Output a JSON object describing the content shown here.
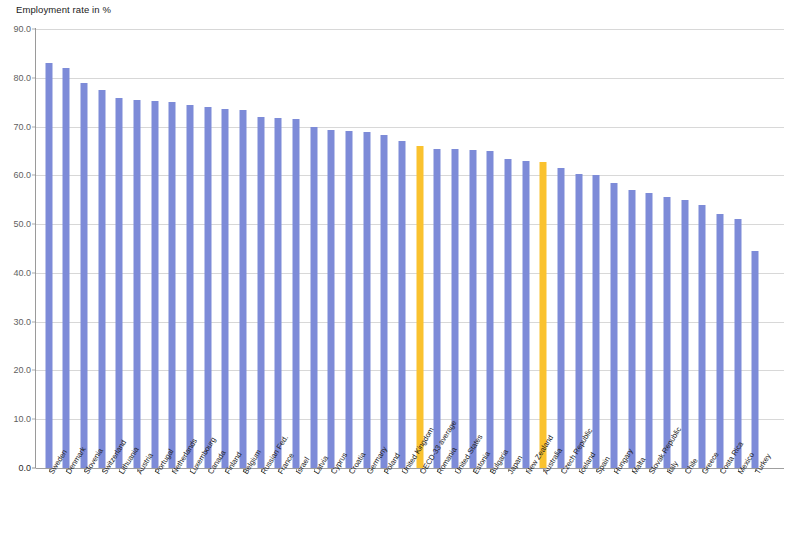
{
  "chart": {
    "title": "Employment rate in %",
    "colors": {
      "bar": "#7d8bd8",
      "highlight": "#fac22e",
      "grid": "#c9c9c9",
      "axis": "#9a9a9a",
      "text": "#1a1a1a"
    }
  },
  "chart_data": {
    "type": "bar",
    "title": "Employment rate in %",
    "xlabel": "",
    "ylabel": "Employment rate in %",
    "ylim": [
      0.0,
      90.0
    ],
    "ytick_labels": [
      "0.0",
      "10.0",
      "20.0",
      "30.0",
      "40.0",
      "50.0",
      "60.0",
      "70.0",
      "80.0",
      "90.0"
    ],
    "yticks": [
      0.0,
      10.0,
      20.0,
      30.0,
      40.0,
      50.0,
      60.0,
      70.0,
      80.0,
      90.0
    ],
    "grid": true,
    "legend": "none",
    "highlight_color": "#fac22e",
    "bar_color": "#7d8bd8",
    "highlighted_categories": [
      "OECD-33 average",
      "Australia"
    ],
    "categories": [
      "Sweden",
      "Denmark",
      "Slovenia",
      "Switzerland",
      "Lithuania",
      "Austria",
      "Portugal",
      "Netherlands",
      "Luxembourg",
      "Canada",
      "Finland",
      "Belgium",
      "Russian Fed.",
      "France",
      "Israel",
      "Latvia",
      "Cyprus",
      "Croatia",
      "Germany",
      "Poland",
      "United Kingdom",
      "OECD-33 average",
      "Romania",
      "United States",
      "Estonia",
      "Bulgaria",
      "Japan",
      "New Zealand",
      "Australia",
      "Czech Republic",
      "Iceland",
      "Spain",
      "Hungary",
      "Malta",
      "Slovak Republic",
      "Italy",
      "Chile",
      "Greece",
      "Costa Rica",
      "Mexico",
      "Turkey"
    ],
    "values": [
      83.0,
      82.0,
      79.0,
      77.5,
      75.8,
      75.5,
      75.3,
      75.0,
      74.5,
      74.0,
      73.5,
      73.3,
      72.0,
      71.8,
      71.5,
      70.0,
      69.3,
      69.0,
      68.8,
      68.2,
      67.0,
      66.0,
      65.5,
      65.3,
      65.2,
      65.0,
      63.3,
      63.0,
      62.8,
      61.5,
      60.2,
      60.0,
      58.5,
      57.0,
      56.3,
      55.5,
      55.0,
      54.0,
      52.0,
      51.0,
      44.4
    ]
  }
}
